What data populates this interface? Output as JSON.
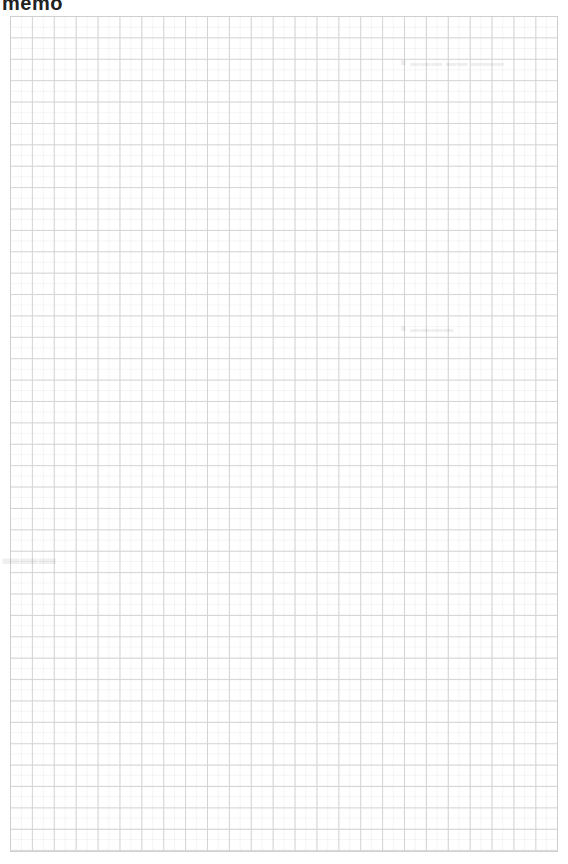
{
  "page": {
    "title": "memo",
    "paper": "grid",
    "grid": {
      "columns": 25,
      "rows": 39,
      "line_color": "#d4d4d4",
      "background": "#ffffff"
    }
  }
}
